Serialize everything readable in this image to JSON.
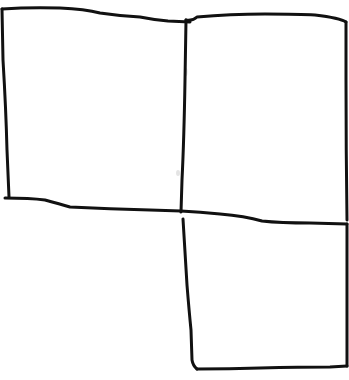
{
  "sketch": {
    "description": "Hand-drawn sketch of three rectangular boxes: two side by side on top, one below the right box",
    "stroke_color": "#111111",
    "background_color": "#ffffff",
    "stroke_width": 3,
    "boxes": [
      {
        "id": "top-left",
        "position": "top-left"
      },
      {
        "id": "top-right",
        "position": "top-right"
      },
      {
        "id": "bottom-right",
        "position": "bottom-right"
      }
    ]
  }
}
